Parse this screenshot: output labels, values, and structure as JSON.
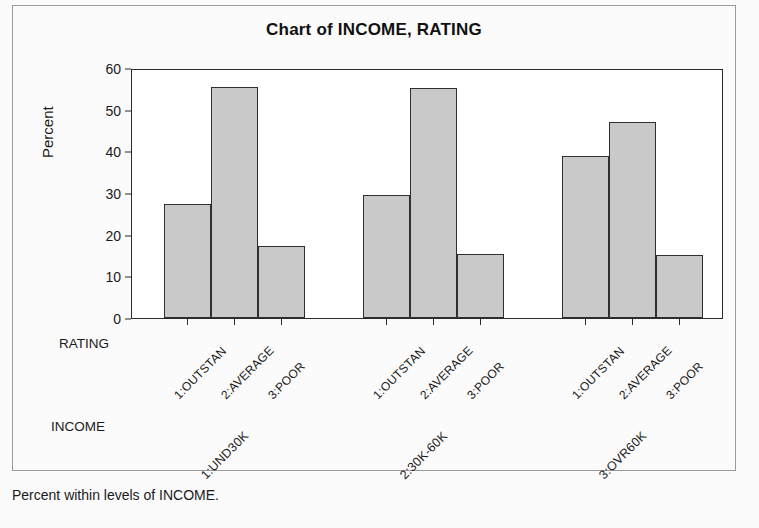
{
  "figure": {
    "title": "Chart of INCOME, RATING",
    "footnote": "Percent within levels of INCOME.",
    "background_color": "#fbfbfb",
    "frame_color": "#9a9a9a"
  },
  "axes": {
    "y_title": "Percent",
    "rating_axis_name": "RATING",
    "income_axis_name": "INCOME"
  },
  "chart_data": {
    "type": "bar",
    "title": "Chart of INCOME, RATING",
    "xlabel": "RATING",
    "ylabel": "Percent",
    "ylim": [
      0,
      60
    ],
    "yticks": [
      0,
      10,
      20,
      30,
      40,
      50,
      60
    ],
    "ytick_labels": [
      "0",
      "10",
      "20",
      "30",
      "40",
      "50",
      "60"
    ],
    "grid": false,
    "legend": false,
    "bar_fill_color": "#c9c9c9",
    "bar_edge_color": "#2f2f2f",
    "categories": [
      "1:OUTSTAN",
      "2:AVERAGE",
      "3:POOR"
    ],
    "groups": [
      {
        "label": "1:UND30K",
        "bars": [
          {
            "category": "1:OUTSTAN",
            "value": 27.4
          },
          {
            "category": "2:AVERAGE",
            "value": 55.4
          },
          {
            "category": "3:POOR",
            "value": 17.3
          }
        ]
      },
      {
        "label": "2:30K-60K",
        "bars": [
          {
            "category": "1:OUTSTAN",
            "value": 29.6
          },
          {
            "category": "2:AVERAGE",
            "value": 55.2
          },
          {
            "category": "3:POOR",
            "value": 15.3
          }
        ]
      },
      {
        "label": "3:OVR60K",
        "bars": [
          {
            "category": "1:OUTSTAN",
            "value": 38.8
          },
          {
            "category": "2:AVERAGE",
            "value": 47.0
          },
          {
            "category": "3:POOR",
            "value": 15.1
          }
        ]
      }
    ],
    "footnote": "Percent within levels of INCOME."
  }
}
